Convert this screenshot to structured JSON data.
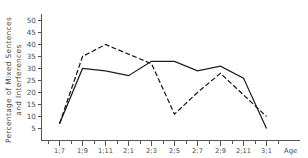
{
  "chart_data": {
    "type": "line",
    "title": "",
    "xlabel": "Age",
    "ylabel": "Percentage of Mixed Sentences and Interferences",
    "ylabel_line1": "Percentage of Mixed Sentences",
    "ylabel_line2": "and Interferences",
    "categories": [
      "1;7",
      "1;9",
      "1;11",
      "2;1",
      "2;3",
      "2;5",
      "2;7",
      "2;9",
      "2;11",
      "3;1"
    ],
    "x_tick_labels": [
      "1;7",
      "1;9",
      "1;11",
      "2;1",
      "2;3",
      "2;5",
      "2;7",
      "2;9",
      "2;11",
      "3;1"
    ],
    "y_tick_labels": [
      "5",
      "10",
      "15",
      "20",
      "25",
      "30",
      "35",
      "40",
      "45",
      "50"
    ],
    "y_tick_values": [
      5,
      10,
      15,
      20,
      25,
      30,
      35,
      40,
      45,
      50
    ],
    "ylim": [
      0,
      52
    ],
    "xlim": [
      0,
      9
    ],
    "grid": false,
    "legend_position": "none",
    "series": [
      {
        "name": "solid-series",
        "style": "solid",
        "color": "#1c1c1e",
        "values": [
          7,
          30,
          29,
          27,
          33,
          33,
          29,
          31,
          26,
          5
        ]
      },
      {
        "name": "dashed-series",
        "style": "dashed",
        "color": "#1c1c1e",
        "values": [
          7,
          35,
          40,
          36,
          32,
          11,
          20,
          28,
          19,
          10
        ]
      }
    ]
  },
  "axes": {
    "x_axis_name": "age-axis",
    "y_axis_name": "percentage-axis"
  }
}
